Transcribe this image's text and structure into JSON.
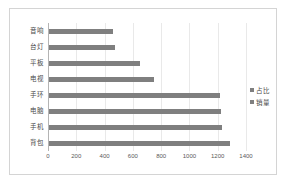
{
  "chart_data": {
    "type": "bar",
    "orientation": "horizontal",
    "title": "",
    "xlabel": "",
    "ylabel": "",
    "categories": [
      "音响",
      "台灯",
      "平板",
      "电视",
      "手环",
      "电脑",
      "手机",
      "背包"
    ],
    "series": [
      {
        "name": "占比",
        "values": [
          null,
          null,
          null,
          null,
          null,
          null,
          null,
          null
        ]
      },
      {
        "name": "销量",
        "values": [
          450,
          470,
          640,
          740,
          1210,
          1215,
          1220,
          1280
        ]
      }
    ],
    "xlim": [
      0,
      1400
    ],
    "xticks": [
      0,
      200,
      400,
      600,
      800,
      1000,
      1200,
      1400
    ],
    "xtick_labels": [
      "0",
      "200",
      "400",
      "600",
      "800",
      "1000",
      "1200",
      "1400"
    ],
    "grid": true,
    "legend_position": "right",
    "bar_color": "#7f7f7f",
    "gridline_color": "#e9e9e9",
    "axis_color": "#b4b4b4",
    "border_color": "#d4d4d4"
  },
  "legend": {
    "items": [
      {
        "label": "占比",
        "color": "#7f7f7f"
      },
      {
        "label": "销量",
        "color": "#7f7f7f"
      }
    ]
  }
}
